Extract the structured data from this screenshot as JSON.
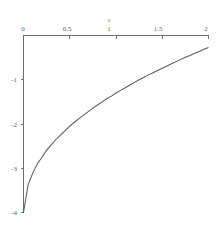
{
  "figure": {
    "background_color": "#ffffff",
    "axis_color": "#6d6d6d",
    "curve_color": "#5a5a5a",
    "tick_label_color": "#5e5e5e"
  },
  "chart_data": {
    "type": "line",
    "title": "",
    "subtitle": "",
    "xlabel": "x",
    "ylabel": "",
    "xlim": [
      0,
      2
    ],
    "ylim": [
      -4,
      0
    ],
    "grid": false,
    "legend": null,
    "x_ticks": [
      {
        "value": 0,
        "label": "0"
      },
      {
        "value": 0.5,
        "label": "0.5"
      },
      {
        "value": 1,
        "label": "1"
      },
      {
        "value": 1.5,
        "label": "1.5"
      },
      {
        "value": 2,
        "label": "2"
      }
    ],
    "y_ticks": [
      {
        "value": -1,
        "label": "-1"
      },
      {
        "value": -2,
        "label": "-2"
      },
      {
        "value": -3,
        "label": "-3"
      },
      {
        "value": -4,
        "label": "-4"
      }
    ],
    "x_axis_position": "top",
    "y_axis_position": "left",
    "series": [
      {
        "name": "curve",
        "x": [
          0.0,
          0.05,
          0.1,
          0.15,
          0.2,
          0.25,
          0.3,
          0.35,
          0.4,
          0.45,
          0.5,
          0.55,
          0.6,
          0.65,
          0.7,
          0.75,
          0.8,
          0.85,
          0.9,
          0.95,
          1.0,
          1.05,
          1.1,
          1.15,
          1.2,
          1.25,
          1.3,
          1.35,
          1.4,
          1.45,
          1.5,
          1.55,
          1.6,
          1.65,
          1.7,
          1.75,
          1.8,
          1.85,
          1.9,
          1.95,
          2.0
        ],
        "y": [
          -4.0,
          -3.37,
          -3.11,
          -2.9,
          -2.75,
          -2.59,
          -2.47,
          -2.35,
          -2.25,
          -2.15,
          -2.05,
          -1.96,
          -1.88,
          -1.8,
          -1.72,
          -1.64,
          -1.57,
          -1.5,
          -1.43,
          -1.37,
          -1.3,
          -1.24,
          -1.18,
          -1.12,
          -1.06,
          -1.0,
          -0.95,
          -0.89,
          -0.84,
          -0.79,
          -0.74,
          -0.69,
          -0.64,
          -0.59,
          -0.54,
          -0.49,
          -0.45,
          -0.4,
          -0.36,
          -0.31,
          -0.27
        ]
      }
    ]
  }
}
